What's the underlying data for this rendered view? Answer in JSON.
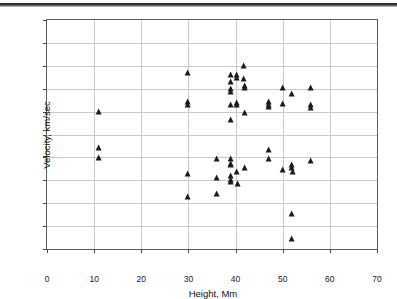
{
  "chart_data": {
    "type": "scatter",
    "title": "",
    "xlabel": "Height, Mm",
    "ylabel": "Velocity, km/sec",
    "xlim": [
      0,
      70
    ],
    "ylim": [
      -50,
      50
    ],
    "xticks": [
      0,
      10,
      20,
      30,
      40,
      50,
      60,
      70
    ],
    "yticks": [
      -50,
      -40,
      -30,
      -20,
      -10,
      0,
      10,
      20,
      30,
      40,
      50
    ],
    "xtick_labels": [
      "0",
      "10",
      "20",
      "30",
      "40",
      "50",
      "60",
      "70"
    ],
    "ytick_labels": [
      "-50",
      "-40",
      "-30",
      "-20",
      "-10",
      "0",
      "10",
      "20",
      "30",
      "40",
      "50"
    ],
    "grid": true,
    "grid_color": "#c9c9c9",
    "marker": "triangle-up",
    "marker_color": "#1c1c1c",
    "legend": null,
    "series": [
      {
        "name": "prominence measurements",
        "points": [
          [
            11.0,
            10.0
          ],
          [
            11.0,
            -6.0
          ],
          [
            11.0,
            -10.2
          ],
          [
            30.0,
            27.0
          ],
          [
            30.0,
            14.2
          ],
          [
            30.0,
            12.8
          ],
          [
            30.0,
            -17.2
          ],
          [
            30.0,
            -27.5
          ],
          [
            36.0,
            -10.8
          ],
          [
            36.0,
            -18.8
          ],
          [
            36.0,
            -25.8
          ],
          [
            39.0,
            26.0
          ],
          [
            39.0,
            22.8
          ],
          [
            39.0,
            19.8
          ],
          [
            39.0,
            18.5
          ],
          [
            39.0,
            12.8
          ],
          [
            39.0,
            6.5
          ],
          [
            39.0,
            -10.5
          ],
          [
            39.0,
            -12.8
          ],
          [
            39.0,
            -13.5
          ],
          [
            39.0,
            -18.0
          ],
          [
            39.0,
            -19.8
          ],
          [
            39.0,
            -20.8
          ],
          [
            40.3,
            26.0
          ],
          [
            40.3,
            24.8
          ],
          [
            40.3,
            13.8
          ],
          [
            40.3,
            13.0
          ],
          [
            40.3,
            -16.2
          ],
          [
            40.5,
            -21.5
          ],
          [
            41.8,
            29.8
          ],
          [
            41.8,
            24.2
          ],
          [
            42.0,
            21.2
          ],
          [
            42.0,
            20.5
          ],
          [
            42.0,
            9.5
          ],
          [
            42.0,
            -14.5
          ],
          [
            47.0,
            14.0
          ],
          [
            47.0,
            12.8
          ],
          [
            47.0,
            12.2
          ],
          [
            47.0,
            -6.8
          ],
          [
            47.0,
            -10.5
          ],
          [
            50.0,
            20.5
          ],
          [
            50.0,
            13.2
          ],
          [
            50.0,
            -15.5
          ],
          [
            52.0,
            17.5
          ],
          [
            52.0,
            -13.5
          ],
          [
            52.0,
            -14.8
          ],
          [
            52.2,
            -16.2
          ],
          [
            52.0,
            -34.5
          ],
          [
            52.0,
            -45.5
          ],
          [
            56.0,
            20.5
          ],
          [
            56.0,
            12.8
          ],
          [
            56.0,
            11.5
          ],
          [
            56.0,
            -11.5
          ]
        ]
      }
    ]
  }
}
